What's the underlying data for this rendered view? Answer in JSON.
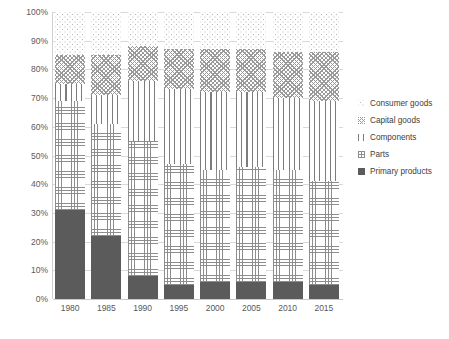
{
  "chart_data": {
    "type": "bar",
    "stacked": true,
    "stack_mode": "percent",
    "title": "",
    "subtitle": "",
    "xlabel": "",
    "ylabel": "",
    "ylim": [
      0,
      100
    ],
    "ytick_labels": [
      "0%",
      "10%",
      "20%",
      "30%",
      "40%",
      "50%",
      "60%",
      "70%",
      "80%",
      "90%",
      "100%"
    ],
    "ytick_values": [
      0,
      10,
      20,
      30,
      40,
      50,
      60,
      70,
      80,
      90,
      100
    ],
    "grid": true,
    "legend_position": "right",
    "categories": [
      "1980",
      "1985",
      "1990",
      "1995",
      "2000",
      "2005",
      "2010",
      "2015"
    ],
    "series": [
      {
        "name": "Primary products",
        "pattern": "solid-dark",
        "color": "#5b5b5b",
        "values": [
          31,
          22,
          8,
          5,
          6,
          6,
          6,
          5
        ]
      },
      {
        "name": "Parts",
        "pattern": "fine-grid",
        "color": "#8d8d8d",
        "values": [
          38,
          39,
          47,
          42,
          39,
          40,
          39,
          36
        ]
      },
      {
        "name": "Components",
        "pattern": "vertical-stripes",
        "color": "#7d7d7d",
        "values": [
          6,
          10,
          21,
          26,
          27,
          26,
          25,
          28
        ]
      },
      {
        "name": "Capital goods",
        "pattern": "crosshatch",
        "color": "#9a9a9a",
        "values": [
          10,
          14,
          12,
          14,
          15,
          15,
          16,
          17
        ]
      },
      {
        "name": "Consumer goods",
        "pattern": "dotted",
        "color": "#b5b5b5",
        "values": [
          15,
          15,
          12,
          13,
          13,
          13,
          14,
          14
        ]
      }
    ]
  },
  "legend": {
    "items": [
      {
        "label": "Consumer goods",
        "swatch": "dotted-swatch"
      },
      {
        "label": "Capital goods",
        "swatch": "crosshatch-swatch"
      },
      {
        "label": "Components",
        "swatch": "vertical-stripes-swatch"
      },
      {
        "label": "Parts",
        "swatch": "fine-grid-swatch"
      },
      {
        "label": "Primary products",
        "swatch": "solid-dark-swatch"
      }
    ]
  }
}
